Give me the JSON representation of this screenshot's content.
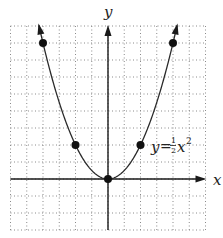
{
  "chart_data": {
    "type": "line",
    "title": "",
    "xlabel": "x",
    "ylabel": "y",
    "xlim": [
      -6,
      6
    ],
    "ylim": [
      -3,
      9
    ],
    "grid": true,
    "grid_style": "dotted",
    "grid_step": 1,
    "tick_labels": false,
    "series": [
      {
        "name": "y = 1/2 x^2",
        "function": "y = 0.5 * x^2",
        "x_range": [
          -4.25,
          4.25
        ],
        "marked_points": [
          {
            "x": -4,
            "y": 8
          },
          {
            "x": -2,
            "y": 2
          },
          {
            "x": 0,
            "y": 0
          },
          {
            "x": 2,
            "y": 2
          },
          {
            "x": 4,
            "y": 8
          }
        ]
      }
    ],
    "annotations": [
      {
        "text": "y = ½x²",
        "x": 2.7,
        "y": 1.6
      }
    ]
  },
  "labels": {
    "x_axis": "x",
    "y_axis": "y",
    "eq_y": "y",
    "eq_equals": "=",
    "eq_num": "1",
    "eq_den": "2",
    "eq_var": "x",
    "eq_exp": "2"
  },
  "colors": {
    "curve": "#2a2a2a",
    "axis": "#1a1a1a",
    "grid": "#8a8a8a",
    "point": "#111111"
  }
}
